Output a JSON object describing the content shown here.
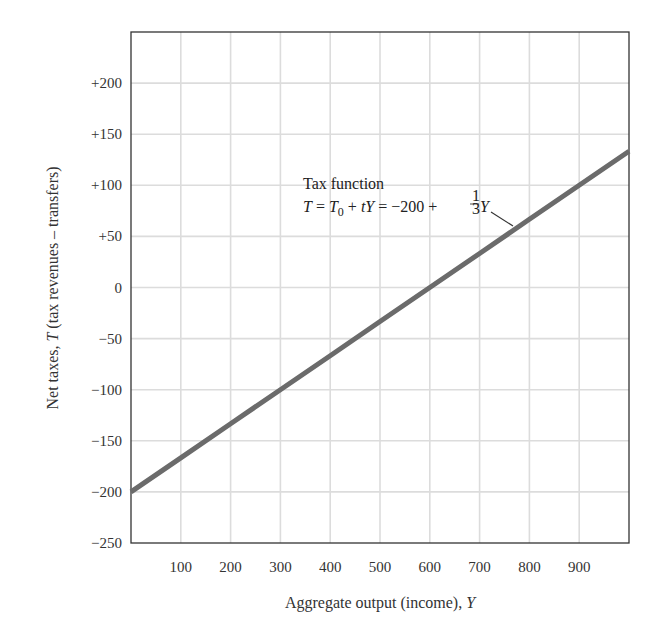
{
  "header_fragment": "aggregate",
  "chart_data": {
    "type": "line",
    "title": "",
    "xlabel": "Aggregate output (income), Y",
    "ylabel": "Net taxes, T (tax revenues – transfers)",
    "xlim": [
      0,
      1000
    ],
    "ylim": [
      -250,
      250
    ],
    "x_ticks": [
      100,
      200,
      300,
      400,
      500,
      600,
      700,
      800,
      900
    ],
    "x_tick_labels": [
      "100",
      "200",
      "300",
      "400",
      "500",
      "600",
      "700",
      "800",
      "900"
    ],
    "y_ticks": [
      200,
      150,
      100,
      50,
      0,
      -50,
      -100,
      -150,
      -200,
      -250
    ],
    "y_tick_labels": [
      "+200",
      "+150",
      "+100",
      "+50",
      "0",
      "−50",
      "−100",
      "−150",
      "−200",
      "−250"
    ],
    "grid": true,
    "series": [
      {
        "name": "Tax function",
        "equation": "T = T0 + tY = −200 + (1/3)Y",
        "x": [
          0,
          100,
          200,
          300,
          400,
          500,
          600,
          700,
          800,
          900,
          1000
        ],
        "y": [
          -200,
          -166.7,
          -133.3,
          -100,
          -66.7,
          -33.3,
          0,
          33.3,
          66.7,
          100,
          133.3
        ],
        "color": "#6b6b6b"
      }
    ],
    "annotations": [
      {
        "text": "Tax function",
        "line2": "T = T0 + tY = −200 + 1/3 Y",
        "points_to_x": 760
      }
    ]
  },
  "labels": {
    "annot_title": "Tax function",
    "annot_eq_T": "T",
    "annot_eq_eq1": " = ",
    "annot_eq_T0": "T",
    "annot_eq_sub0": "0",
    "annot_eq_plus": " + ",
    "annot_eq_tY": "tY",
    "annot_eq_rest": " = −200 + ",
    "annot_frac_num": "1",
    "annot_frac_den": "3",
    "annot_eq_Y": "Y",
    "xlabel_text": "Aggregate output (income), ",
    "xlabel_var": "Y",
    "ylabel_text1": "Net taxes, ",
    "ylabel_var": "T",
    "ylabel_text2": " (tax revenues – transfers)"
  }
}
